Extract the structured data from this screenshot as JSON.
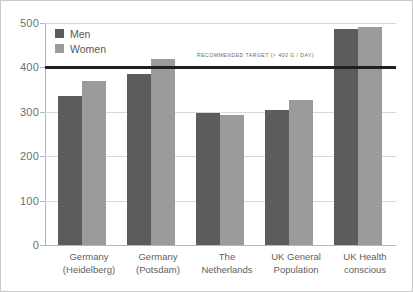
{
  "chart_data": {
    "type": "bar",
    "title": "",
    "xlabel": "",
    "ylabel": "",
    "ylim": [
      0,
      500
    ],
    "grid": true,
    "legend_position": "top-left",
    "categories": [
      "Germany (Heidelberg)",
      "Germany (Potsdam)",
      "The Netherlands",
      "UK General Population",
      "UK Health conscious"
    ],
    "category_lines": [
      [
        "Germany",
        "(Heidelberg)"
      ],
      [
        "Germany",
        "(Potsdam)"
      ],
      [
        "The",
        "Netherlands"
      ],
      [
        "UK General",
        "Population"
      ],
      [
        "UK Health",
        "conscious"
      ]
    ],
    "series": [
      {
        "name": "Men",
        "color": "#5c5c5c",
        "values": [
          335,
          385,
          297,
          303,
          487
        ]
      },
      {
        "name": "Women",
        "color": "#9b9b9b",
        "values": [
          370,
          420,
          292,
          327,
          492
        ]
      }
    ],
    "yticks": [
      500,
      400,
      300,
      200,
      100,
      0
    ],
    "annotations": [
      {
        "name": "recommended-target-line",
        "text": "RECOMMENDED TARGET (> 400 G / DAY)",
        "value": 400,
        "color": "#231f20"
      }
    ]
  },
  "legend": {
    "items": [
      {
        "label": "Men",
        "color": "#5c5c5c"
      },
      {
        "label": "Women",
        "color": "#9b9b9b"
      }
    ]
  }
}
